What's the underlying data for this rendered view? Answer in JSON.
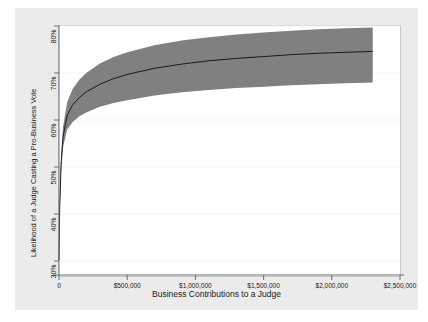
{
  "chart_data": {
    "type": "line",
    "title": "",
    "xlabel": "Business Contributions to a Judge",
    "ylabel": "Likelihood of a Judge Casting a Pro-Business Vote",
    "xlim": [
      0,
      2500000
    ],
    "ylim": [
      30,
      80
    ],
    "grid": true,
    "legend": null,
    "xtick_labels": [
      "0",
      "$500,000",
      "$1,000,000",
      "$1,500,000",
      "$2,000,000",
      "$2,500,000"
    ],
    "xtick_values": [
      0,
      500000,
      1000000,
      1500000,
      2000000,
      2500000
    ],
    "ytick_labels": [
      "30%",
      "40%",
      "50%",
      "60%",
      "70%",
      "80%"
    ],
    "ytick_values": [
      30,
      40,
      50,
      60,
      70,
      80
    ],
    "series": [
      {
        "name": "Predicted likelihood",
        "kind": "line",
        "x": [
          0,
          5000,
          15000,
          30000,
          60000,
          100000,
          150000,
          200000,
          300000,
          400000,
          500000,
          700000,
          900000,
          1100000,
          1300000,
          1500000,
          1700000,
          1900000,
          2100000,
          2300000
        ],
        "y": [
          30.2,
          41.0,
          50.5,
          56.5,
          61.0,
          63.2,
          64.8,
          66.0,
          67.6,
          68.8,
          69.7,
          71.0,
          71.9,
          72.6,
          73.1,
          73.5,
          73.9,
          74.2,
          74.4,
          74.6
        ]
      },
      {
        "name": "95% confidence interval upper bound",
        "kind": "band-upper",
        "x": [
          0,
          5000,
          15000,
          30000,
          60000,
          100000,
          150000,
          200000,
          300000,
          400000,
          500000,
          700000,
          900000,
          1100000,
          1300000,
          1500000,
          1700000,
          1900000,
          2100000,
          2300000
        ],
        "y": [
          30.6,
          41.8,
          52.0,
          58.6,
          63.8,
          66.6,
          68.6,
          70.0,
          72.0,
          73.4,
          74.4,
          75.9,
          76.9,
          77.6,
          78.2,
          78.6,
          79.0,
          79.3,
          79.5,
          79.7
        ]
      },
      {
        "name": "95% confidence interval lower bound",
        "kind": "band-lower",
        "x": [
          0,
          5000,
          15000,
          30000,
          60000,
          100000,
          150000,
          200000,
          300000,
          400000,
          500000,
          700000,
          900000,
          1100000,
          1300000,
          1500000,
          1700000,
          1900000,
          2100000,
          2300000
        ],
        "y": [
          29.8,
          40.2,
          48.9,
          54.3,
          58.0,
          59.6,
          60.8,
          61.6,
          62.8,
          63.6,
          64.2,
          65.2,
          65.9,
          66.4,
          66.8,
          67.1,
          67.4,
          67.6,
          67.8,
          68.0
        ]
      }
    ],
    "colors": {
      "band": "#808080",
      "line": "#1a1a1a",
      "grid": "#f2f2f2",
      "axis": "#6e6e6e",
      "plot_background": "#ffffff",
      "figure_background": "#ebebeb"
    }
  }
}
